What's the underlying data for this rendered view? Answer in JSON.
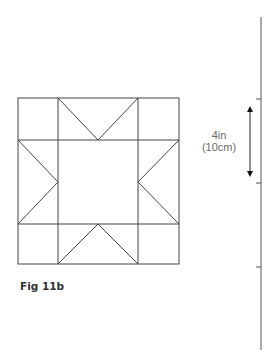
{
  "figure": {
    "caption": "Fig 11b",
    "block": {
      "x": 18,
      "y": 98,
      "right": 179,
      "bottom": 264,
      "cols": [
        58,
        138
      ],
      "rows": [
        140,
        224
      ],
      "stroke": "#444444"
    },
    "ruler": {
      "x": 261,
      "top": 17,
      "bottom": 350,
      "ticks": [
        99,
        183,
        267
      ],
      "stroke": "#555555"
    },
    "measure": {
      "line1": "4in",
      "line2": "(10cm)",
      "arrow_x": 250,
      "arrow_top": 106,
      "arrow_bottom": 177
    }
  }
}
